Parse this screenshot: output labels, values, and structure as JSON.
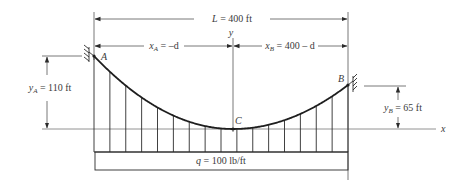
{
  "figure": {
    "span_label": "L = 400 ft",
    "span": {
      "var": "L",
      "eq": " = 400 ft"
    },
    "xA_label": {
      "var": "x",
      "sub": "A",
      "eq": " = –d"
    },
    "xB_label": {
      "var": "x",
      "sub": "B",
      "eq": " = 400 – d"
    },
    "yA_label": {
      "var": "y",
      "sub": "A",
      "eq": " = 110 ft"
    },
    "yB_label": {
      "var": "y",
      "sub": "B",
      "eq": " = 65 ft"
    },
    "load_label": {
      "var": "q",
      "eq": " = 100 lb/ft"
    },
    "point_A": "A",
    "point_B": "B",
    "point_C": "C",
    "axis_x": "x",
    "axis_y": "y",
    "hanger_count": 17
  },
  "colors": {
    "line": "#2b2b2b",
    "thin": "#555555",
    "text": "#3a3a3a"
  }
}
